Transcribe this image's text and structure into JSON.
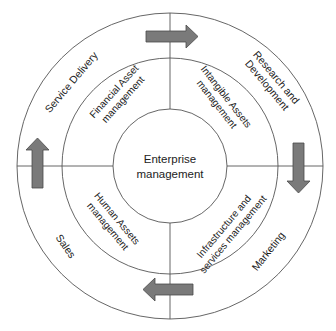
{
  "diagram": {
    "center": {
      "line1": "Enterprise",
      "line2": "management"
    },
    "inner_ring": {
      "top_left": {
        "line1": "Financial Asset",
        "line2": "management"
      },
      "top_right": {
        "line1": "Intangible Assets",
        "line2": "management"
      },
      "bottom_right": {
        "line1": "Infrastructure and",
        "line2": "services management"
      },
      "bottom_left": {
        "line1": "Human Assets",
        "line2": "management"
      }
    },
    "outer_ring": {
      "top_left": {
        "line1": "Service Delivery"
      },
      "top_right": {
        "line1": "Research and",
        "line2": "Development"
      },
      "bottom_right": {
        "line1": "Marketing"
      },
      "bottom_left": {
        "line1": "Sales"
      }
    },
    "arrows": [
      {
        "position": "top",
        "direction": "right"
      },
      {
        "position": "right",
        "direction": "down"
      },
      {
        "position": "bottom",
        "direction": "left"
      },
      {
        "position": "left",
        "direction": "up"
      }
    ],
    "colors": {
      "line": "#555555",
      "arrow_fill": "#7a7a7a",
      "arrow_stroke": "#4a4a4a",
      "text": "#222222"
    }
  }
}
